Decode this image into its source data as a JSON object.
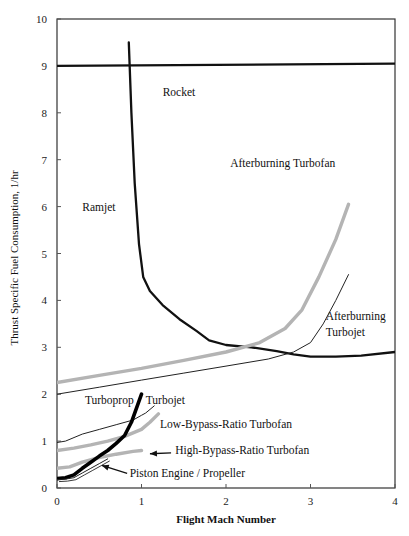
{
  "chart_data": {
    "type": "line",
    "title": "",
    "xlabel": "Flight Mach Number",
    "ylabel": "Thrust Specific Fuel Consumption, 1/hr",
    "xlim": [
      0,
      4
    ],
    "ylim": [
      0,
      10
    ],
    "x_ticks": [
      "0",
      "1",
      "2",
      "3",
      "4"
    ],
    "y_ticks": [
      "0",
      "1",
      "2",
      "3",
      "4",
      "5",
      "6",
      "7",
      "8",
      "9",
      "10"
    ],
    "grid": false,
    "legend": "none (direct labels)",
    "series": [
      {
        "name": "Rocket",
        "style": "thick-black",
        "x": [
          0,
          4
        ],
        "y": [
          9.0,
          9.05
        ]
      },
      {
        "name": "Ramjet",
        "style": "thick-black",
        "x": [
          0.85,
          0.88,
          0.92,
          0.97,
          1.02,
          1.1,
          1.25,
          1.45,
          1.65,
          1.8,
          2.0,
          2.3,
          2.6,
          2.8,
          3.0,
          3.3,
          3.6,
          4.0
        ],
        "y": [
          9.5,
          8.0,
          6.5,
          5.2,
          4.5,
          4.2,
          3.9,
          3.6,
          3.35,
          3.15,
          3.05,
          3.0,
          2.92,
          2.85,
          2.8,
          2.8,
          2.82,
          2.9
        ]
      },
      {
        "name": "Afterburning Turbofan",
        "style": "thick-gray",
        "x": [
          0,
          0.5,
          1.0,
          1.5,
          2.0,
          2.4,
          2.7,
          2.9,
          3.1,
          3.3,
          3.45
        ],
        "y": [
          2.25,
          2.4,
          2.55,
          2.72,
          2.9,
          3.1,
          3.4,
          3.8,
          4.5,
          5.3,
          6.05
        ]
      },
      {
        "name": "Afterburning Turbojet",
        "style": "thin-black",
        "x": [
          0,
          0.5,
          1.0,
          1.5,
          2.0,
          2.5,
          2.8,
          3.0,
          3.15,
          3.3,
          3.45
        ],
        "y": [
          2.0,
          2.15,
          2.3,
          2.45,
          2.6,
          2.75,
          2.9,
          3.1,
          3.5,
          4.0,
          4.55
        ]
      },
      {
        "name": "Turbojet",
        "style": "thin-black",
        "x": [
          0,
          0.1,
          0.3,
          0.5,
          0.7,
          0.9,
          1.0,
          1.05,
          1.15
        ],
        "y": [
          0.97,
          1.0,
          1.15,
          1.25,
          1.35,
          1.45,
          1.55,
          1.6,
          1.75
        ]
      },
      {
        "name": "Low-Bypass-Ratio Turbofan",
        "style": "thick-gray",
        "x": [
          0,
          0.2,
          0.4,
          0.6,
          0.8,
          1.0,
          1.1,
          1.2
        ],
        "y": [
          0.8,
          0.85,
          0.92,
          1.0,
          1.1,
          1.25,
          1.4,
          1.58
        ]
      },
      {
        "name": "High-Bypass-Ratio Turbofan",
        "style": "thick-gray",
        "x": [
          0,
          0.15,
          0.3,
          0.5,
          0.7,
          0.9,
          1.0
        ],
        "y": [
          0.42,
          0.45,
          0.55,
          0.65,
          0.72,
          0.78,
          0.8
        ]
      },
      {
        "name": "Turboprop",
        "style": "extra-thick-black",
        "x": [
          0,
          0.1,
          0.2,
          0.3,
          0.4,
          0.5,
          0.6,
          0.7,
          0.8,
          0.88,
          0.95,
          1.0
        ],
        "y": [
          0.2,
          0.22,
          0.28,
          0.42,
          0.55,
          0.68,
          0.8,
          0.95,
          1.12,
          1.4,
          1.75,
          2.0
        ]
      },
      {
        "name": "Piston Engine / Propeller",
        "style": "double-thin-black",
        "x": [
          0,
          0.1,
          0.2,
          0.3,
          0.4,
          0.5,
          0.6
        ],
        "y": [
          0.18,
          0.19,
          0.22,
          0.32,
          0.42,
          0.52,
          0.62
        ]
      }
    ],
    "annotations": [
      {
        "text": "Rocket",
        "x": 1.25,
        "y": 8.35
      },
      {
        "text": "Ramjet",
        "x": 0.3,
        "y": 5.9
      },
      {
        "text": "Afterburning Turbofan",
        "x": 2.05,
        "y": 6.85
      },
      {
        "text": "Afterburning",
        "x": 3.18,
        "y": 3.58
      },
      {
        "text": "Turbojet",
        "x": 3.18,
        "y": 3.25
      },
      {
        "text": "Turbojet",
        "x": 1.05,
        "y": 1.8
      },
      {
        "text": "Turboprop",
        "x": 0.33,
        "y": 1.8
      },
      {
        "text": "Low-Bypass-Ratio Turbofan",
        "x": 1.22,
        "y": 1.27
      },
      {
        "text": "High-Bypass-Ratio Turbofan",
        "x": 1.4,
        "y": 0.73
      },
      {
        "text": "Piston Engine / Propeller",
        "x": 0.86,
        "y": 0.23
      }
    ],
    "arrows": [
      {
        "from": [
          1.35,
          0.75
        ],
        "to": [
          1.1,
          0.73
        ]
      },
      {
        "from": [
          0.83,
          0.31
        ],
        "to": [
          0.53,
          0.48
        ]
      }
    ]
  }
}
